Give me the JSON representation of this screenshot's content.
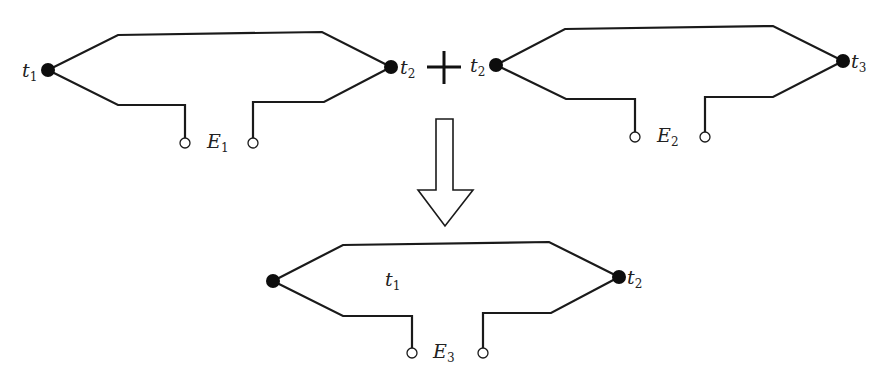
{
  "diagram": {
    "colors": {
      "line": "#1a1a1a",
      "background": "#ffffff"
    },
    "thermocouples": [
      {
        "id": "tc1",
        "left_junction": {
          "label": "t",
          "sub": "1"
        },
        "right_junction": {
          "label": "t",
          "sub": "2"
        },
        "emf": {
          "label": "E",
          "sub": "1"
        }
      },
      {
        "id": "tc2",
        "left_junction": {
          "label": "t",
          "sub": "2"
        },
        "right_junction": {
          "label": "t",
          "sub": "3"
        },
        "emf": {
          "label": "E",
          "sub": "2"
        }
      },
      {
        "id": "tc3",
        "left_junction": {
          "label": "",
          "sub": ""
        },
        "inner_label": {
          "label": "t",
          "sub": "1"
        },
        "right_junction": {
          "label": "t",
          "sub": "2"
        },
        "emf": {
          "label": "E",
          "sub": "3"
        }
      }
    ],
    "operator": "+",
    "result_arrow": "down-arrow"
  }
}
